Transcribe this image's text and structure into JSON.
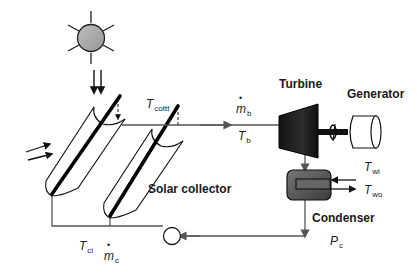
{
  "diagram": {
    "type": "solar-thermal-power-cycle",
    "colors": {
      "line": "#555555",
      "outline": "#111111",
      "sun_fill": "#a9a9a9",
      "turbine_fill": "#1c1c1c",
      "condenser_fill": "#5a5a5a",
      "background": "#ffffff"
    },
    "components": {
      "sun": {
        "label": "",
        "icon": "sun-icon"
      },
      "solar_collector": {
        "label": "Solar collector",
        "count": 2
      },
      "turbine": {
        "label": "Turbine"
      },
      "generator": {
        "label": "Generator"
      },
      "condenser": {
        "label": "Condenser"
      },
      "pump": {
        "label": "",
        "icon": "pump-icon"
      }
    },
    "variables": {
      "collector_outlet_temp": {
        "symbol": "T",
        "sub": "cottt"
      },
      "boiler_mass_flow": {
        "symbol": "m",
        "sub": "b",
        "dot": true
      },
      "boiler_temp": {
        "symbol": "T",
        "sub": "b"
      },
      "water_inlet_temp": {
        "symbol": "T",
        "sub": "wi"
      },
      "water_outlet_temp": {
        "symbol": "T",
        "sub": "wo"
      },
      "condenser_pressure": {
        "symbol": "P",
        "sub": "c"
      },
      "collector_inlet_temp": {
        "symbol": "T",
        "sub": "ci"
      },
      "collector_mass_flow": {
        "symbol": "m",
        "sub": "c",
        "dot": true
      }
    }
  }
}
